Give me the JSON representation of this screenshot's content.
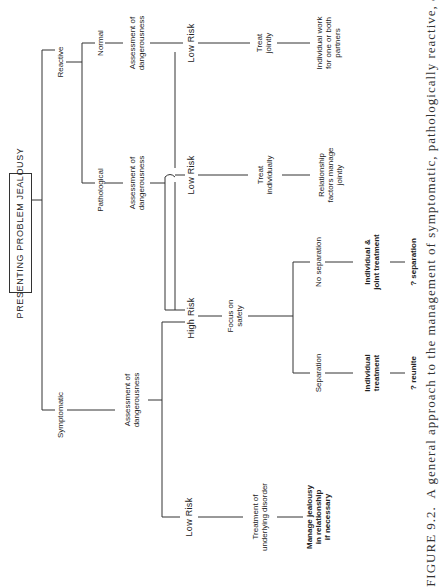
{
  "diagram": {
    "root": "PRESENTING PROBLEM JEALOUSY",
    "reactive": "Reactive",
    "symptomatic": "Symptomatic",
    "normal": "Normal",
    "pathological": "Pathological",
    "normal_assessment": "Assessment of\ndangerousness",
    "normal_low_risk": "Low Risk",
    "treat_jointly": "Treat\njointly",
    "individual_work": "Individual work\nfor one or both\npartners",
    "path_assessment": "Assessment of\ndangerousness",
    "path_low_risk": "Low Risk",
    "treat_individually": "Treat\nindividually",
    "relationship_factors": "Relationship\nfactors manage\njointly",
    "high_risk": "High Risk",
    "focus_on_safety": "Focus on\nsafety",
    "separation": "Separation",
    "no_separation": "No separation",
    "individual_treatment": "Individual\ntreatment",
    "individual_joint_treatment": "Individual &\njoint treatment",
    "reunite": "? reunite",
    "q_separation": "? separation",
    "sym_assessment": "Assessment of\ndangerousness",
    "sym_low_risk": "Low Risk",
    "treatment_underlying": "Treatment of\nunderlying disorder",
    "manage_jealousy": "Manage jealousy\nin relationship\nif necessary"
  },
  "caption": "FIGURE 9.2.  A general approach to the management of symptomatic, pathologically reactive, and"
}
